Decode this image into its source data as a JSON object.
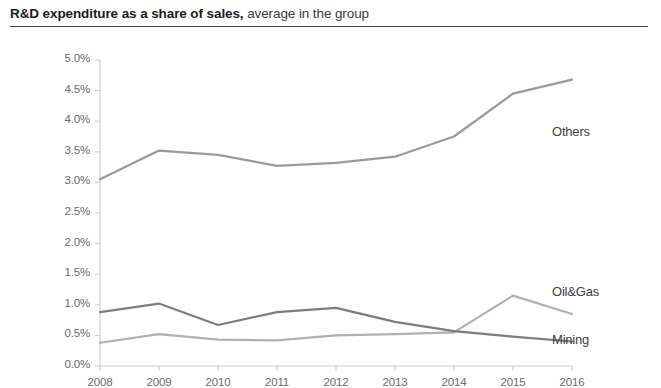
{
  "title": {
    "strong": "R&D expenditure as a share of sales,",
    "rest": " average in the group"
  },
  "colors": {
    "others_line": "#9a9a9a",
    "oilgas_line": "#b0b0b0",
    "mining_line": "#7d7d7d",
    "axis": "#c9c9c9",
    "tick_text": "#6b6b6b",
    "title_text": "#1c1c1c",
    "rule": "#4a4a4a"
  },
  "chart_data": {
    "type": "line",
    "title": "R&D expenditure as a share of sales, average in the group",
    "xlabel": "",
    "ylabel": "",
    "categories": [
      "2008",
      "2009",
      "2010",
      "2011",
      "2012",
      "2013",
      "2014",
      "2015",
      "2016"
    ],
    "x_tick_labels": [
      "2008",
      "2009",
      "2010",
      "2011",
      "2012",
      "2013",
      "2014",
      "2015",
      "2016"
    ],
    "y_tick_labels": [
      "0.0%",
      "0.5%",
      "1.0%",
      "1.5%",
      "2.0%",
      "2.5%",
      "3.0%",
      "3.5%",
      "4.0%",
      "4.5%",
      "5.0%"
    ],
    "y_tick_values": [
      0.0,
      0.5,
      1.0,
      1.5,
      2.0,
      2.5,
      3.0,
      3.5,
      4.0,
      4.5,
      5.0
    ],
    "ylim": [
      0.0,
      5.0
    ],
    "y_unit": "%",
    "grid": false,
    "legend": "inline-right-labels",
    "series": [
      {
        "name": "Others",
        "label": "Others",
        "color": "#9a9a9a",
        "values": [
          3.05,
          3.52,
          3.45,
          3.27,
          3.32,
          3.42,
          3.75,
          4.45,
          4.68
        ]
      },
      {
        "name": "Oil&Gas",
        "label": "Oil&Gas",
        "color": "#b0b0b0",
        "values": [
          0.38,
          0.52,
          0.43,
          0.42,
          0.5,
          0.52,
          0.55,
          1.15,
          0.85
        ]
      },
      {
        "name": "Mining",
        "label": "Mining",
        "color": "#7d7d7d",
        "values": [
          0.88,
          1.02,
          0.67,
          0.88,
          0.95,
          0.72,
          0.57,
          0.48,
          0.4
        ]
      }
    ]
  }
}
